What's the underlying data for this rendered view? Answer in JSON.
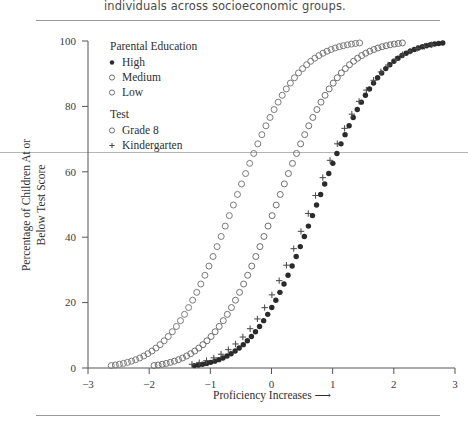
{
  "page": {
    "header_text": "individuals across socioeconomic groups."
  },
  "chart_data": {
    "type": "scatter",
    "title": "",
    "xlabel": "Proficiency Increases  ⟶",
    "ylabel_line1": "Percentage of Children At or",
    "ylabel_line2": "Below Test Score",
    "xlim": [
      -3,
      3
    ],
    "ylim": [
      0,
      100
    ],
    "xticks": [
      -3,
      -2,
      -1,
      0,
      1,
      2,
      3
    ],
    "xtick_labels": [
      "−3",
      "−2",
      "−1",
      "0",
      "1",
      "2",
      "3"
    ],
    "yticks": [
      0,
      20,
      40,
      60,
      80,
      100
    ],
    "ytick_labels": [
      "0",
      "20",
      "40",
      "60",
      "80",
      "100"
    ],
    "grid": false,
    "legend_position": "upper-left-inside",
    "legend_groups": [
      {
        "title": "Parental Education",
        "entries": [
          {
            "label": "High",
            "marker": "filled-circle",
            "color": "#2b2b2b"
          },
          {
            "label": "Medium",
            "marker": "open-circle",
            "color": "#6f6f6f"
          },
          {
            "label": "Low",
            "marker": "open-circle",
            "color": "#7b7b7b"
          }
        ]
      },
      {
        "title": "Test",
        "entries": [
          {
            "label": "Grade 8",
            "marker": "open-circle",
            "color": "#6f6f6f"
          },
          {
            "label": "Kindergarten",
            "marker": "plus",
            "color": "#4a4a4a"
          }
        ]
      }
    ],
    "series": [
      {
        "name": "Low",
        "group": "Parental Education",
        "marker": "open-circle",
        "marker_size": 3.0,
        "color": "#7b7b7b",
        "n_points": 62,
        "curve": "cumulative-normal",
        "mean": -0.62,
        "sd": 0.82,
        "x_start": -2.62,
        "x_end": 1.44,
        "comment": "Leftmost sigmoid; reaches ~100% near x=1.4"
      },
      {
        "name": "Medium",
        "group": "Parental Education",
        "marker": "open-circle",
        "marker_size": 3.0,
        "color": "#6f6f6f",
        "n_points": 62,
        "curve": "cumulative-normal",
        "mean": 0.08,
        "sd": 0.82,
        "x_start": -1.92,
        "x_end": 2.14,
        "comment": "Middle sigmoid; shifted ~0.70 right of Low"
      },
      {
        "name": "High",
        "group": "Parental Education",
        "marker": "filled-circle",
        "marker_size": 2.7,
        "color": "#2b2b2b",
        "n_points": 62,
        "curve": "cumulative-normal",
        "mean": 0.74,
        "sd": 0.82,
        "x_start": -1.26,
        "x_end": 2.8,
        "comment": "Rightmost sigmoid; shifted ~0.66 right of Medium"
      },
      {
        "name": "Kindergarten",
        "group": "Test",
        "marker": "plus",
        "marker_size": 3.2,
        "color": "#4a4a4a",
        "n_points": 34,
        "curve": "cumulative-normal",
        "mean": 0.66,
        "sd": 0.86,
        "x_start": -1.3,
        "x_end": 2.62,
        "comment": "Plus markers tracking just left of the High curve"
      }
    ]
  }
}
